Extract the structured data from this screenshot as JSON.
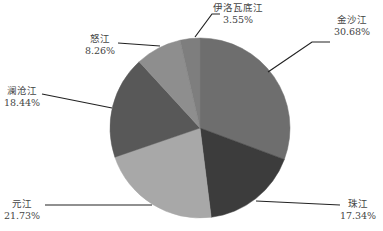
{
  "chart_data": {
    "type": "pie",
    "title": "",
    "start_angle_deg": 0,
    "direction": "clockwise",
    "center": [
      200,
      128
    ],
    "radius": 90,
    "slices": [
      {
        "label": "金沙江",
        "value": 30.68,
        "value_label": "30.68%",
        "color": "#6e6e6e",
        "label_pos": [
          352,
          14
        ],
        "line": [
          [
            330,
            42
          ],
          [
            312,
            42
          ],
          [
            268,
            72
          ]
        ]
      },
      {
        "label": "珠江",
        "value": 17.34,
        "value_label": "17.34%",
        "color": "#3c3c3c",
        "label_pos": [
          358,
          198
        ],
        "line": [
          [
            340,
            205
          ],
          [
            256,
            201
          ]
        ]
      },
      {
        "label": "元江",
        "value": 21.73,
        "value_label": "21.73%",
        "color": "#a8a8a8",
        "label_pos": [
          22,
          198
        ],
        "line": [
          [
            45,
            205
          ],
          [
            152,
            205
          ]
        ]
      },
      {
        "label": "澜沧江",
        "value": 18.44,
        "value_label": "18.44%",
        "color": "#585858",
        "label_pos": [
          22,
          85
        ],
        "line": [
          [
            42,
            94
          ],
          [
            112,
            108
          ]
        ]
      },
      {
        "label": "怒江",
        "value": 8.26,
        "value_label": "8.26%",
        "color": "#8e8e8e",
        "label_pos": [
          100,
          33
        ],
        "line": [
          [
            118,
            43
          ],
          [
            160,
            46
          ]
        ]
      },
      {
        "label": "伊洛瓦底江",
        "value": 3.55,
        "value_label": "3.55%",
        "color": "#7e7e7e",
        "label_pos": [
          238,
          2
        ],
        "line": [
          [
            220,
            14
          ],
          [
            212,
            14
          ],
          [
            195,
            37
          ]
        ]
      }
    ]
  }
}
